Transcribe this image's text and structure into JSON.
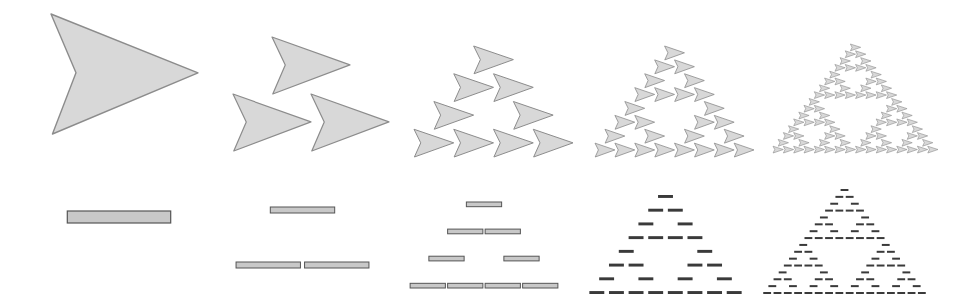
{
  "figure": {
    "description": "Sierpinski-triangle iterations built from arrow shapes (top row) and bar segments (bottom row), levels 0 through 4",
    "colors": {
      "arrow_fill": "#d8d8d8",
      "arrow_stroke": "#8c8c8c",
      "bar_fill": "#c8c8c8",
      "bar_stroke": "#555555",
      "bar_dark": "#3a3a3a",
      "background": "#ffffff"
    }
  },
  "arrow_row": {
    "label": "Arrow iterations",
    "panels": [
      {
        "level": 0,
        "count": 1,
        "bbox": [
          51,
          14,
          198,
          134
        ]
      },
      {
        "level": 1,
        "count": 3,
        "bbox": [
          233,
          37,
          389,
          151
        ]
      },
      {
        "level": 2,
        "count": 9,
        "bbox": [
          414,
          46,
          573,
          157
        ]
      },
      {
        "level": 3,
        "count": 27,
        "bbox": [
          595,
          46,
          754,
          157
        ]
      },
      {
        "level": 4,
        "count": 81,
        "bbox": [
          773,
          44,
          938,
          153
        ]
      }
    ]
  },
  "bar_row": {
    "label": "Bar iterations",
    "panels": [
      {
        "level": 0,
        "count": 1,
        "bbox": [
          64,
          211,
          174,
          223
        ]
      },
      {
        "level": 1,
        "count": 3,
        "bbox": [
          234,
          207,
          371,
          268
        ]
      },
      {
        "level": 2,
        "count": 9,
        "bbox": [
          409,
          202,
          559,
          288
        ]
      },
      {
        "level": 3,
        "count": 27,
        "bbox": [
          587,
          195,
          744,
          294
        ]
      },
      {
        "level": 4,
        "count": 81,
        "bbox": [
          762,
          189,
          927,
          294
        ]
      }
    ]
  }
}
